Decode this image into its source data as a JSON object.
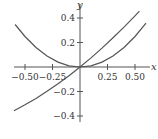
{
  "chart_data": {
    "type": "line",
    "title": "",
    "xlabel": "x",
    "ylabel": "y",
    "xlim": [
      -0.6,
      0.6
    ],
    "ylim": [
      -0.45,
      0.5
    ],
    "grid": false,
    "legend": null,
    "x_ticks": [
      -0.5,
      -0.25,
      0.25,
      0.5
    ],
    "x_tick_labels": [
      "−0.50",
      "−0.25",
      "0.25",
      "0.50"
    ],
    "y_ticks": [
      0.4,
      0.2,
      -0.2,
      -0.4
    ],
    "y_tick_labels": [
      "0.4",
      "0.2",
      "−0.2",
      "−0.4"
    ],
    "series": [
      {
        "name": "parabola (approx. y = x²)",
        "x": [
          -0.59,
          -0.5,
          -0.4,
          -0.3,
          -0.2,
          -0.1,
          0,
          0.1,
          0.2,
          0.3,
          0.4,
          0.5,
          0.6
        ],
        "y": [
          0.348,
          0.25,
          0.16,
          0.09,
          0.04,
          0.01,
          0,
          0.01,
          0.04,
          0.09,
          0.16,
          0.25,
          0.36
        ]
      },
      {
        "name": "increasing curve through origin",
        "x": [
          -0.6,
          -0.5,
          -0.4,
          -0.3,
          -0.2,
          -0.1,
          0,
          0.1,
          0.2,
          0.3,
          0.4,
          0.5,
          0.54
        ],
        "y": [
          -0.359,
          -0.31,
          -0.257,
          -0.199,
          -0.137,
          -0.071,
          0,
          0.075,
          0.155,
          0.239,
          0.327,
          0.42,
          0.458
        ]
      }
    ],
    "colors": {
      "curve": "#555555",
      "axis": "#555555",
      "text": "#333333"
    }
  }
}
